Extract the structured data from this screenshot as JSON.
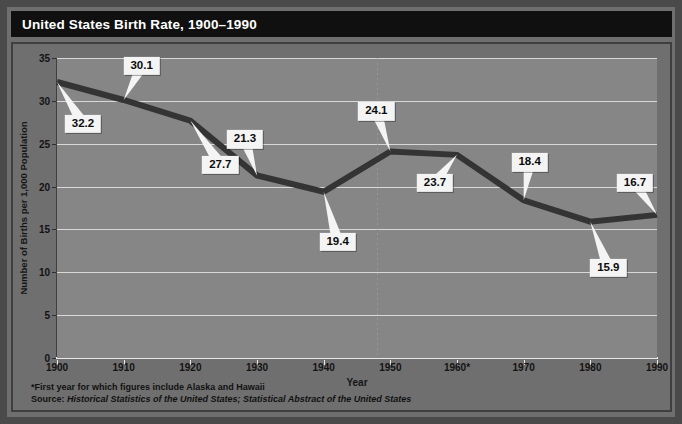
{
  "title": "United States Birth Rate, 1900–1990",
  "footnotes": {
    "asterisk": "*First year for which figures include Alaska and Hawaii",
    "source_lead": "Source:",
    "source_text": " Historical Statistics of the United States; Statistical Abstract of the United States"
  },
  "colors": {
    "title_bar": "#101010",
    "panel_bg": "#6f6f6f",
    "plot_bg": "#868686",
    "gridline": "#d8d8d8",
    "series_line": "#343434",
    "callout_bg": "#f4f4f4",
    "frame": "#4a4a4a"
  },
  "chart_data": {
    "type": "line",
    "title": "United States Birth Rate, 1900–1990",
    "xlabel": "Year",
    "ylabel": "Number of Births per 1,000 Population",
    "x": [
      1900,
      1910,
      1920,
      1930,
      1940,
      1950,
      1960,
      1970,
      1980,
      1990
    ],
    "xtick_labels": [
      "1900",
      "1910",
      "1920",
      "1930",
      "1940",
      "1950",
      "1960*",
      "1970",
      "1980",
      "1990"
    ],
    "values": [
      32.2,
      30.1,
      27.7,
      21.3,
      19.4,
      24.1,
      23.7,
      18.4,
      15.9,
      16.7
    ],
    "point_labels": [
      "32.2",
      "30.1",
      "27.7",
      "21.3",
      "19.4",
      "24.1",
      "23.7",
      "18.4",
      "15.9",
      "16.7"
    ],
    "ylim": [
      0,
      35
    ],
    "yticks": [
      0,
      5,
      10,
      15,
      20,
      25,
      30,
      35
    ],
    "ytick_labels": [
      "0",
      "5",
      "10",
      "15",
      "20",
      "25",
      "30",
      "35"
    ],
    "xlim": [
      1900,
      1990
    ],
    "grid": "horizontal",
    "legend": "none",
    "annotations": [
      {
        "label": "32.2",
        "x": 1900,
        "y": 32.2
      },
      {
        "label": "30.1",
        "x": 1910,
        "y": 30.1
      },
      {
        "label": "27.7",
        "x": 1920,
        "y": 27.7
      },
      {
        "label": "21.3",
        "x": 1930,
        "y": 21.3
      },
      {
        "label": "19.4",
        "x": 1940,
        "y": 19.4
      },
      {
        "label": "24.1",
        "x": 1950,
        "y": 24.1
      },
      {
        "label": "23.7",
        "x": 1960,
        "y": 23.7
      },
      {
        "label": "18.4",
        "x": 1970,
        "y": 18.4
      },
      {
        "label": "15.9",
        "x": 1980,
        "y": 15.9
      },
      {
        "label": "16.7",
        "x": 1990,
        "y": 16.7
      }
    ]
  }
}
